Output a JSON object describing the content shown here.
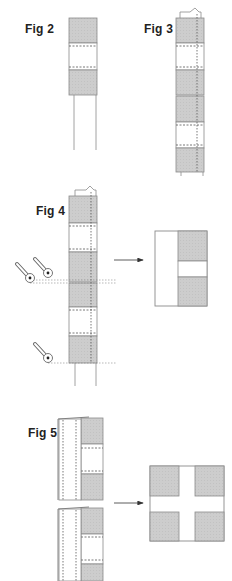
{
  "figures": [
    {
      "id": "fig2",
      "label": "Fig 2"
    },
    {
      "id": "fig3",
      "label": "Fig 3"
    },
    {
      "id": "fig4",
      "label": "Fig 4"
    },
    {
      "id": "fig5",
      "label": "Fig 5"
    }
  ],
  "colors": {
    "shade": "#cfcfcf",
    "line": "#8a8a8a",
    "dash": "#555555",
    "arrow": "#333333"
  }
}
